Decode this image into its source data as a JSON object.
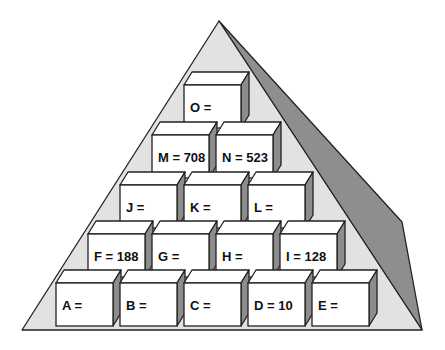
{
  "diagram": {
    "type": "number-pyramid",
    "colors": {
      "background": "#ffffff",
      "pyramid_front": "#e2e2e2",
      "pyramid_shadow": "#8e8e8e",
      "block_front": "#ffffff",
      "block_side": "#8c8c8c",
      "block_top": "#ffffff",
      "outline": "#222222",
      "text": "#111111"
    },
    "rows": [
      {
        "name": "row-5-top",
        "blocks": [
          {
            "id": "O",
            "label": "O =",
            "value": ""
          }
        ]
      },
      {
        "name": "row-4",
        "blocks": [
          {
            "id": "M",
            "label": "M = 708",
            "value": "708"
          },
          {
            "id": "N",
            "label": "N = 523",
            "value": "523"
          }
        ]
      },
      {
        "name": "row-3",
        "blocks": [
          {
            "id": "J",
            "label": "J =",
            "value": ""
          },
          {
            "id": "K",
            "label": "K =",
            "value": ""
          },
          {
            "id": "L",
            "label": "L =",
            "value": ""
          }
        ]
      },
      {
        "name": "row-2",
        "blocks": [
          {
            "id": "F",
            "label": "F = 188",
            "value": "188"
          },
          {
            "id": "G",
            "label": "G =",
            "value": ""
          },
          {
            "id": "H",
            "label": "H =",
            "value": ""
          },
          {
            "id": "I",
            "label": "I = 128",
            "value": "128"
          }
        ]
      },
      {
        "name": "row-1-base",
        "blocks": [
          {
            "id": "A",
            "label": "A =",
            "value": ""
          },
          {
            "id": "B",
            "label": "B =",
            "value": ""
          },
          {
            "id": "C",
            "label": "C =",
            "value": ""
          },
          {
            "id": "D",
            "label": "D = 10",
            "value": "10"
          },
          {
            "id": "E",
            "label": "E =",
            "value": ""
          }
        ]
      }
    ]
  }
}
